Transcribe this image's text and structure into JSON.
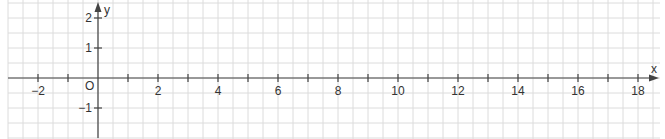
{
  "chart_data": {
    "type": "coordinate-grid",
    "title": "",
    "xlabel": "x",
    "ylabel": "y",
    "origin_label": "O",
    "xlim": [
      -3,
      18.5
    ],
    "ylim": [
      -2,
      2.3
    ],
    "grid": true,
    "grid_step": 0.5,
    "x_tick_labels": [
      "-2",
      "2",
      "4",
      "6",
      "8",
      "10",
      "12",
      "14",
      "16",
      "18"
    ],
    "x_tick_values": [
      -2,
      2,
      4,
      6,
      8,
      10,
      12,
      14,
      16,
      18
    ],
    "x_minor_ticks": [
      -1,
      1,
      3,
      5,
      7,
      9,
      11,
      13,
      15,
      17
    ],
    "y_tick_labels": [
      "2",
      "1",
      "-1"
    ],
    "y_tick_values": [
      2,
      1,
      -1
    ],
    "series": []
  },
  "colors": {
    "grid": "#dcdcdc",
    "axis": "#444444",
    "text": "#333333"
  },
  "labels": {
    "x_axis": "x",
    "y_axis": "y",
    "origin": "O"
  }
}
